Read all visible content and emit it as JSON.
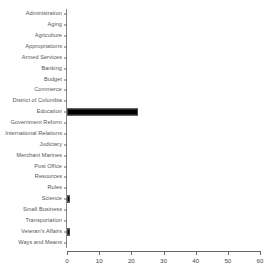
{
  "chart_data": {
    "type": "bar",
    "orientation": "horizontal",
    "title": "",
    "title_note": "title clipped off top edge of screenshot, illegible",
    "xlabel": "",
    "ylabel": "",
    "xlim": [
      0,
      60
    ],
    "xticks": [
      0,
      10,
      20,
      30,
      40,
      50,
      60
    ],
    "xtick_labels": [
      "0",
      "10",
      "20",
      "30",
      "40",
      "50",
      "60"
    ],
    "grid": false,
    "legend": false,
    "bar_color": "#000000",
    "bar_border_color": "#4d4d4d",
    "axis_color": "#666666",
    "label_color": "#555555",
    "categories": [
      "Administration",
      "Aging",
      "Agriculture",
      "Appropriations",
      "Armed Services",
      "Banking",
      "Budget",
      "Commerce",
      "District of Columbia",
      "Education",
      "Government Reform",
      "International Relations",
      "Judiciary",
      "Merchant Marines",
      "Post Office",
      "Resources",
      "Rules",
      "Science",
      "Small Business",
      "Transportation",
      "Veteran's Affairs",
      "Ways and Means"
    ],
    "values": [
      0,
      0,
      0,
      0,
      0,
      0,
      0,
      0,
      0,
      22,
      0,
      0,
      0,
      0,
      0,
      0,
      0,
      1,
      0,
      0,
      1,
      0
    ]
  }
}
